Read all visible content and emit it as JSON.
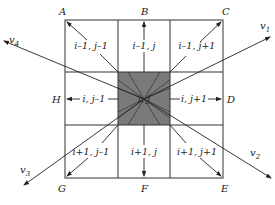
{
  "diagram": {
    "title": "",
    "grid": {
      "rows": 3,
      "cols": 3,
      "center_fill": "#7a7a7a",
      "line_color": "#333333"
    },
    "corners": {
      "A": "A",
      "B": "B",
      "C": "C",
      "D": "D",
      "E": "E",
      "F": "F",
      "G": "G",
      "H": "H"
    },
    "cells": {
      "top_left": "i–1, j–1",
      "top_center": "i–1, j",
      "top_right": "i–1, j+1",
      "middle_left": "i, j–1",
      "center": "i, j",
      "middle_right": "i, j+1",
      "bottom_left": "i+1, j–1",
      "bottom_center": "i+1, j",
      "bottom_right": "i+1, j+1"
    },
    "vectors": {
      "v1": {
        "base": "v",
        "sub": "1"
      },
      "v2": {
        "base": "v",
        "sub": "2"
      },
      "v3": {
        "base": "v",
        "sub": "3"
      },
      "v4": {
        "base": "v",
        "sub": "4"
      }
    }
  }
}
